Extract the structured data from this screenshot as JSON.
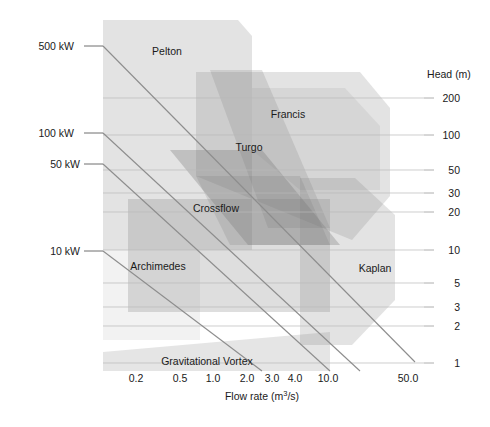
{
  "chart_data": {
    "type": "area",
    "xlabel": "Flow rate (m3/s)",
    "xlabel_base": "Flow rate (m",
    "xlabel_sup": "3",
    "xlabel_tail": "/s)",
    "ylabel": "Head (m)",
    "xscale": "log",
    "yscale": "log",
    "xlim": [
      0.12,
      80
    ],
    "ylim": [
      0.85,
      260
    ],
    "grid": true,
    "legend": "none",
    "xticks": [
      {
        "label": "0.2",
        "value": 0.2,
        "x": 136
      },
      {
        "label": "0.5",
        "value": 0.5,
        "x": 180
      },
      {
        "label": "1.0",
        "value": 1.0,
        "x": 213
      },
      {
        "label": "2.0",
        "value": 2.0,
        "x": 247
      },
      {
        "label": "3.0",
        "value": 3.0,
        "x": 272
      },
      {
        "label": "4.0",
        "value": 4.0,
        "x": 295
      },
      {
        "label": "10.0",
        "value": 10.0,
        "x": 328
      },
      {
        "label": "50.0",
        "value": 50.0,
        "x": 408
      }
    ],
    "yticks": [
      {
        "label": "200",
        "value": 200,
        "y": 98
      },
      {
        "label": "100",
        "value": 100,
        "y": 135
      },
      {
        "label": "50",
        "value": 50,
        "y": 170
      },
      {
        "label": "30",
        "value": 30,
        "y": 193
      },
      {
        "label": "20",
        "value": 20,
        "y": 212
      },
      {
        "label": "10",
        "value": 10,
        "y": 250
      },
      {
        "label": "5",
        "value": 5,
        "y": 283
      },
      {
        "label": "3",
        "value": 3,
        "y": 307
      },
      {
        "label": "2",
        "value": 2,
        "y": 326
      },
      {
        "label": "1",
        "value": 1,
        "y": 363
      }
    ],
    "power_lines": [
      {
        "label": "500 kW",
        "kw": 500,
        "label_x": 48,
        "label_y": 46
      },
      {
        "label": "100 kW",
        "kw": 100,
        "label_x": 48,
        "label_y": 133
      },
      {
        "label": "50 kW",
        "kw": 50,
        "label_x": 54,
        "label_y": 164
      },
      {
        "label": "10 kW",
        "kw": 10,
        "label_x": 54,
        "label_y": 251
      }
    ],
    "zones": [
      {
        "name": "Pelton",
        "label_x": 167,
        "label_y": 51,
        "fill": "#d8d8d8"
      },
      {
        "name": "Francis",
        "label_x": 288,
        "label_y": 114,
        "fill": "#d0d0d0"
      },
      {
        "name": "Turgo",
        "label_x": 249,
        "label_y": 147,
        "fill": "#c8c8c8"
      },
      {
        "name": "Crossflow",
        "label_x": 216,
        "label_y": 208,
        "fill": "#b0b0b0"
      },
      {
        "name": "Archimedes",
        "label_x": 158,
        "label_y": 266,
        "fill": "#c4c4c4"
      },
      {
        "name": "Kaplan",
        "label_x": 375,
        "label_y": 268,
        "fill": "#d4d4d4"
      },
      {
        "name": "Gravitational Vortex",
        "label_x": 207,
        "label_y": 361,
        "fill": "#d9d9d9"
      }
    ]
  },
  "axes": {
    "head_title": "Head (m)",
    "head_title_x": 449,
    "head_title_y": 78,
    "flow_title_x": 262,
    "flow_title_y": 400
  },
  "colors": {
    "background": "#ffffff",
    "grid": "#b9b9b9",
    "power_line": "#8d8d8d",
    "text": "#1a1a1a",
    "zone_light": "#dcdcdc",
    "zone_mid": "#c4c4c4",
    "zone_dark": "#a0a0a0",
    "zone_darkest": "#8e8e8e"
  }
}
